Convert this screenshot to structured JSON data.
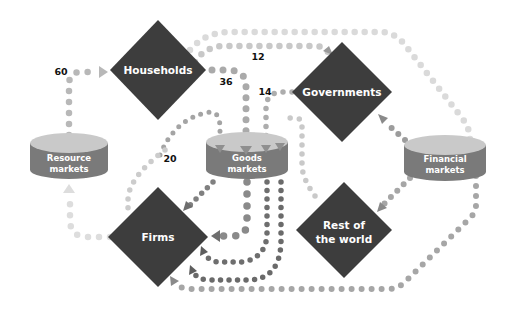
{
  "diagram": {
    "colors": {
      "actor_fill": "#3d3d3d",
      "cylinder_top": "#c9c9c9",
      "cylinder_side": "#7a7a7a",
      "dot_light": "#d9d9d9",
      "dot_mid": "#b3b3b3",
      "dot_dark": "#7f7f7f",
      "label_text": "#ffffff"
    },
    "actors": [
      {
        "id": "households",
        "label": "Households"
      },
      {
        "id": "governments",
        "label": "Governments"
      },
      {
        "id": "firms",
        "label": "Firms"
      },
      {
        "id": "rest_of_world",
        "label_line1": "Rest of",
        "label_line2": "the world"
      }
    ],
    "markets": [
      {
        "id": "resource",
        "label_line1": "Resource",
        "label_line2": "markets"
      },
      {
        "id": "goods",
        "label_line1": "Goods",
        "label_line2": "markets"
      },
      {
        "id": "financial",
        "label_line1": "Financial",
        "label_line2": "markets"
      }
    ],
    "flows": [
      {
        "from": "Resource markets",
        "to": "Households",
        "value": "60"
      },
      {
        "from": "Households",
        "to": "Goods markets",
        "value": "36"
      },
      {
        "from": "Households",
        "to": "Governments",
        "value": "12"
      },
      {
        "from": "Governments",
        "to": "Goods markets",
        "value": "14"
      },
      {
        "from": "Goods markets",
        "to": "Firms",
        "value": "20"
      },
      {
        "from": "Firms",
        "to": "Resource markets",
        "value": ""
      },
      {
        "from": "Households",
        "to": "Financial markets",
        "value": ""
      },
      {
        "from": "Financial markets",
        "to": "Governments",
        "value": ""
      },
      {
        "from": "Financial markets",
        "to": "Rest of the world",
        "value": ""
      },
      {
        "from": "Financial markets",
        "to": "Firms",
        "value": ""
      },
      {
        "from": "Rest of the world",
        "to": "Goods markets",
        "value": ""
      },
      {
        "from": "Goods markets",
        "to": "Firms (multiple)",
        "value": ""
      }
    ]
  }
}
